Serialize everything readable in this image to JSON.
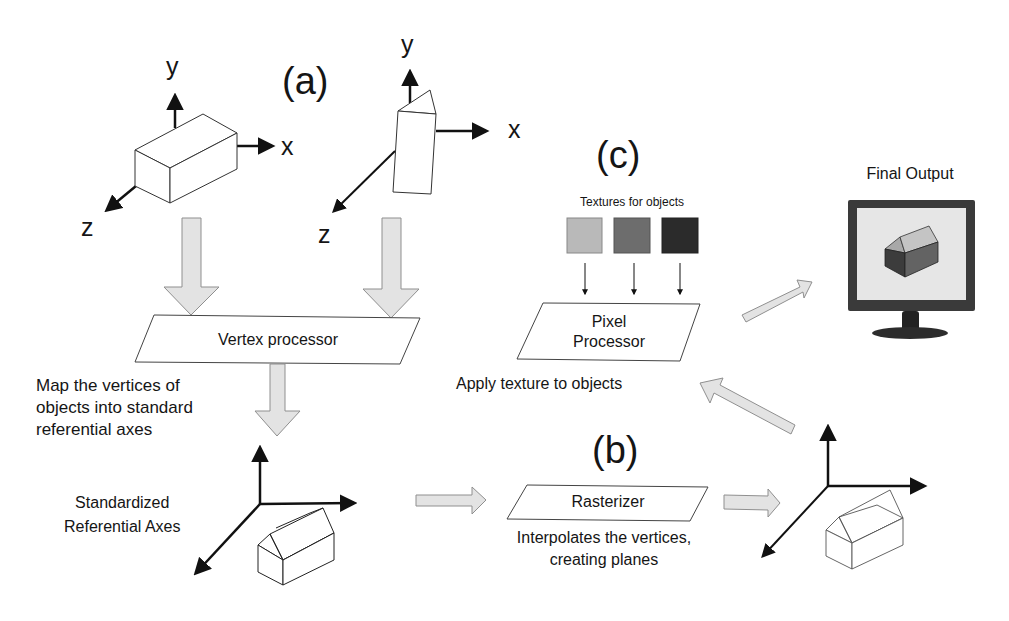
{
  "sections": {
    "a": "(a)",
    "b": "(b)",
    "c": "(c)"
  },
  "axes": {
    "x": "x",
    "y": "y",
    "z": "z"
  },
  "vertex_processor": {
    "label": "Vertex processor",
    "description_lines": [
      "Map the vertices of",
      "objects into standard",
      "referential axes"
    ]
  },
  "standardized_axes": {
    "label_lines": [
      "Standardized",
      "Referential Axes"
    ]
  },
  "rasterizer": {
    "label": "Rasterizer",
    "description_lines": [
      "Interpolates the vertices,",
      "creating planes"
    ]
  },
  "pixel_processor": {
    "label_lines": [
      "Pixel",
      "Processor"
    ],
    "description": "Apply texture to objects"
  },
  "textures": {
    "title": "Textures for objects",
    "swatches": [
      {
        "name": "light-gray-texture",
        "color": "#b9b9b9"
      },
      {
        "name": "medium-gray-texture",
        "color": "#6d6d6d"
      },
      {
        "name": "dark-gray-texture",
        "color": "#2b2b2b"
      }
    ]
  },
  "final_output": {
    "title": "Final Output"
  },
  "colors": {
    "arrow_fill": "#e3e3e3",
    "arrow_stroke": "#8f8f8f",
    "line": "#111111"
  }
}
